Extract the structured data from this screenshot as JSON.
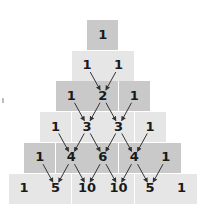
{
  "diagram": {
    "rows": [
      [
        1
      ],
      [
        1,
        1
      ],
      [
        1,
        2,
        1
      ],
      [
        1,
        3,
        3,
        1
      ],
      [
        1,
        4,
        6,
        4,
        1
      ],
      [
        1,
        5,
        10,
        10,
        5,
        1
      ]
    ],
    "row_shading": [
      "dark",
      "light",
      "dark",
      "light",
      "dark",
      "light"
    ],
    "colors": {
      "dark_cell": "#c9c9c9",
      "light_cell": "#e6e6e6",
      "text": "#1a1a1a",
      "arrow": "#333333"
    },
    "arrows": "each inner cell receives arrows from the two cells above it"
  }
}
